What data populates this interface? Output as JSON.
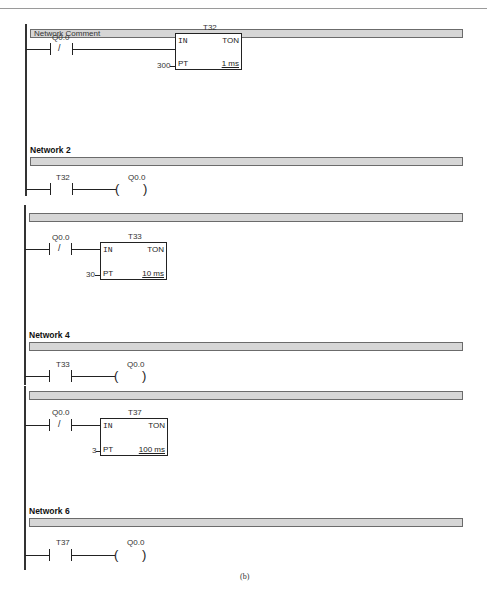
{
  "header": {
    "title_partial": ""
  },
  "caption": "(b)",
  "segments": [
    {
      "comment_bar": "Network Comment",
      "rung": {
        "contact": {
          "address": "Q0.0",
          "type": "normally-closed",
          "symbol": "/"
        },
        "timer": {
          "name": "T32",
          "in": "IN",
          "type": "TON",
          "pt_label": "PT",
          "preset": "300",
          "base": "1 ms"
        }
      }
    },
    {
      "title": "Network 2",
      "rung": {
        "contact": {
          "address": "T32",
          "type": "normally-open"
        },
        "coil": {
          "address": "Q0.0"
        }
      }
    },
    {
      "comment_bar": "",
      "rung": {
        "contact": {
          "address": "Q0.0",
          "type": "normally-closed",
          "symbol": "/"
        },
        "timer": {
          "name": "T33",
          "in": "IN",
          "type": "TON",
          "pt_label": "PT",
          "preset": "30",
          "base": "10 ms"
        }
      }
    },
    {
      "title": "Network 4",
      "rung": {
        "contact": {
          "address": "T33",
          "type": "normally-open"
        },
        "coil": {
          "address": "Q0.0"
        }
      }
    },
    {
      "comment_bar": "",
      "rung": {
        "contact": {
          "address": "Q0.0",
          "type": "normally-closed",
          "symbol": "/"
        },
        "timer": {
          "name": "T37",
          "in": "IN",
          "type": "TON",
          "pt_label": "PT",
          "preset": "3",
          "base": "100 ms"
        }
      }
    },
    {
      "title": "Network 6",
      "rung": {
        "contact": {
          "address": "T37",
          "type": "normally-open"
        },
        "coil": {
          "address": "Q0.0"
        }
      }
    }
  ],
  "coil_symbol": {
    "left": "(",
    "right": ")"
  }
}
